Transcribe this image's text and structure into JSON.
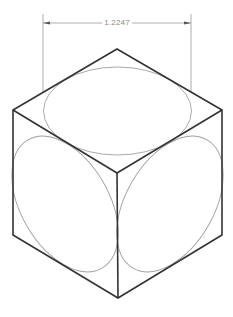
{
  "drawing": {
    "title": "Isometric cube with inscribed circles",
    "dimension": {
      "value": "1.2247",
      "line_y": 23,
      "x_start": 43,
      "x_end": 191,
      "extension_top": 14,
      "extension_bottom": 93,
      "color": "#8a8a8a"
    },
    "cube": {
      "edge_color": "#333333",
      "vertices": {
        "top": [
          117,
          49
        ],
        "left_top": [
          13,
          110
        ],
        "right_top": [
          222,
          110
        ],
        "front_top": [
          117,
          173
        ],
        "left_bottom": [
          13,
          235
        ],
        "right_bottom": [
          222,
          235
        ],
        "bottom": [
          118,
          298
        ]
      }
    },
    "ellipses": [
      {
        "face": "top",
        "cx": 117.5,
        "cy": 111,
        "rx": 74,
        "ry": 44,
        "rotate": 0
      },
      {
        "face": "left",
        "cx": 65,
        "cy": 204,
        "rx": 74,
        "ry": 44,
        "rotate": 60
      },
      {
        "face": "right",
        "cx": 170,
        "cy": 204,
        "rx": 74,
        "ry": 44,
        "rotate": -60
      }
    ],
    "ellipse_color": "#9a9a9a",
    "marker": {
      "x": 204,
      "y": 237
    }
  }
}
